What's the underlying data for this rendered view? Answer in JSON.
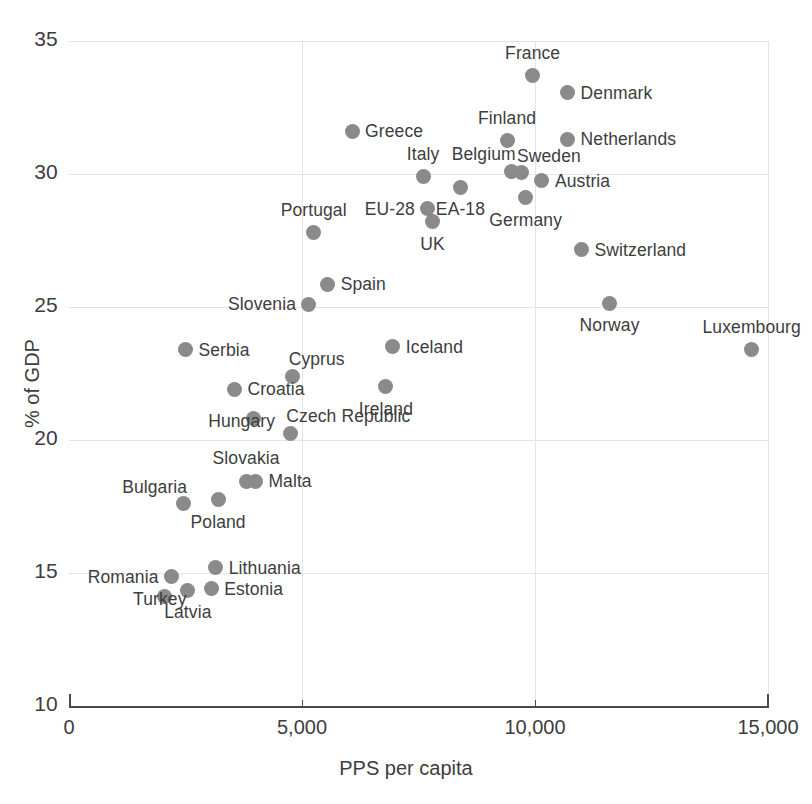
{
  "chart_data": {
    "type": "scatter",
    "title": "",
    "xlabel": "PPS per capita",
    "ylabel": "% of GDP",
    "xlim": [
      0,
      15000
    ],
    "ylim": [
      10,
      35
    ],
    "xticks": [
      0,
      5000,
      10000,
      15000
    ],
    "xtick_labels": [
      "0",
      "5,000",
      "10,000",
      "15,000"
    ],
    "yticks": [
      10,
      15,
      20,
      25,
      30,
      35
    ],
    "ytick_labels": [
      "10",
      "15",
      "20",
      "25",
      "30",
      "35"
    ],
    "grid": true,
    "legend": "none",
    "marker_color": "#8a8a8a",
    "points": [
      {
        "name": "France",
        "x": 9950,
        "y": 33.7,
        "label_pos": "above"
      },
      {
        "name": "Denmark",
        "x": 10700,
        "y": 33.05,
        "label_pos": "right"
      },
      {
        "name": "Greece",
        "x": 6075,
        "y": 31.6,
        "label_pos": "right"
      },
      {
        "name": "Finland",
        "x": 9400,
        "y": 31.25,
        "label_pos": "above"
      },
      {
        "name": "Netherlands",
        "x": 10700,
        "y": 31.3,
        "label_pos": "right"
      },
      {
        "name": "Belgium",
        "x": 9500,
        "y": 30.1,
        "label_pos": "above-left"
      },
      {
        "name": "Sweden",
        "x": 9700,
        "y": 30.05,
        "label_pos": "above-right"
      },
      {
        "name": "Italy",
        "x": 7600,
        "y": 29.9,
        "label_pos": "above"
      },
      {
        "name": "Austria",
        "x": 10150,
        "y": 29.75,
        "label_pos": "right"
      },
      {
        "name": "EA-18",
        "x": 8400,
        "y": 29.5,
        "label_pos": "below"
      },
      {
        "name": "Germany",
        "x": 9800,
        "y": 29.1,
        "label_pos": "below"
      },
      {
        "name": "EU-28",
        "x": 7700,
        "y": 28.7,
        "label_pos": "left"
      },
      {
        "name": "UK",
        "x": 7800,
        "y": 28.2,
        "label_pos": "below"
      },
      {
        "name": "Portugal",
        "x": 5250,
        "y": 27.8,
        "label_pos": "above"
      },
      {
        "name": "Switzerland",
        "x": 11000,
        "y": 27.15,
        "label_pos": "right"
      },
      {
        "name": "Spain",
        "x": 5550,
        "y": 25.85,
        "label_pos": "right"
      },
      {
        "name": "Slovenia",
        "x": 5150,
        "y": 25.1,
        "label_pos": "left"
      },
      {
        "name": "Norway",
        "x": 11600,
        "y": 25.15,
        "label_pos": "below"
      },
      {
        "name": "Serbia",
        "x": 2500,
        "y": 23.4,
        "label_pos": "right"
      },
      {
        "name": "Iceland",
        "x": 6950,
        "y": 23.5,
        "label_pos": "right"
      },
      {
        "name": "Luxembourg",
        "x": 14650,
        "y": 23.4,
        "label_pos": "above"
      },
      {
        "name": "Cyprus",
        "x": 4800,
        "y": 22.4,
        "label_pos": "above-right"
      },
      {
        "name": "Ireland",
        "x": 6800,
        "y": 22.0,
        "label_pos": "below"
      },
      {
        "name": "Croatia",
        "x": 3550,
        "y": 21.9,
        "label_pos": "right"
      },
      {
        "name": "Hungary",
        "x": 3950,
        "y": 20.8,
        "label_pos": "below-left"
      },
      {
        "name": "Czech Republic",
        "x": 4750,
        "y": 20.25,
        "label_pos": "above-right"
      },
      {
        "name": "Slovakia",
        "x": 3800,
        "y": 18.45,
        "label_pos": "above"
      },
      {
        "name": "Malta",
        "x": 4000,
        "y": 18.45,
        "label_pos": "right"
      },
      {
        "name": "Bulgaria",
        "x": 2450,
        "y": 17.6,
        "label_pos": "above-left"
      },
      {
        "name": "Poland",
        "x": 3200,
        "y": 17.75,
        "label_pos": "below"
      },
      {
        "name": "Lithuania",
        "x": 3150,
        "y": 15.2,
        "label_pos": "right"
      },
      {
        "name": "Romania",
        "x": 2200,
        "y": 14.85,
        "label_pos": "left"
      },
      {
        "name": "Estonia",
        "x": 3050,
        "y": 14.4,
        "label_pos": "right"
      },
      {
        "name": "Latvia",
        "x": 2550,
        "y": 14.35,
        "label_pos": "below"
      },
      {
        "name": "Turkey",
        "x": 2050,
        "y": 14.1,
        "label_pos": "below-left"
      }
    ]
  }
}
